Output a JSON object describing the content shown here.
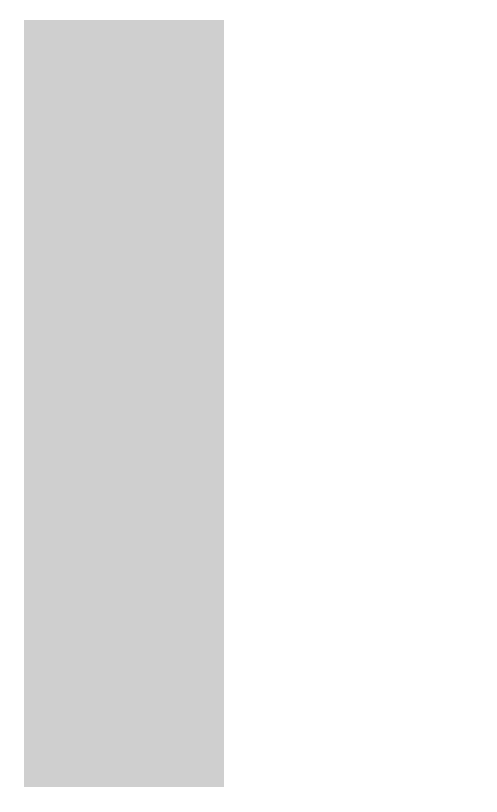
{
  "map": {
    "title_note": "DATE OF ACQUISITION GIVEN FOR U.S. POSSESSIONS",
    "colors": {
      "ocean": "#cfcfcf",
      "land": "#ffffff",
      "us_possession": "#8a8a8a",
      "outline": "#1a1a1a",
      "frame": "#222222"
    },
    "countries": {
      "canada": "CANADA",
      "united_states": "UNITED STATES",
      "mexico": "MEXICO",
      "south": "SOUTH",
      "america": "AMERICA",
      "russia": "RUSSIA",
      "china": "CHINA",
      "japan": "JAPAN",
      "australia": "AUSTRALIA"
    },
    "water": {
      "bering": "BERING",
      "sea": "SEA",
      "pacific": "PACIFIC",
      "ocean": "OCEAN"
    },
    "lines": {
      "equator": "EQUATOR",
      "international": "INTERNATIONAL",
      "date": "DATE",
      "line": "LINE"
    },
    "possessions": {
      "alaska": {
        "name": "ALASKA",
        "year": "(1867)"
      },
      "aleutian": {
        "name": "ALEUTIAN IS."
      },
      "midway": {
        "name": "MIDWAY IS.",
        "year": "(1867)"
      },
      "hawaiian": {
        "name": "HAWAIIAN IS.",
        "year": "(1898)"
      },
      "wake": {
        "name": "WAKE IS.",
        "year": "(1899)"
      },
      "guam": {
        "name": "GUAM",
        "year": "(1898)"
      },
      "philippine": {
        "name1": "PHILIPPINE",
        "name2": "ISLANDS",
        "year": "(1898)"
      },
      "samoa": {
        "name1": "AMERICAN",
        "name2": "SAMOA",
        "year": "(1899)"
      },
      "panama": {
        "name1": "PANAMA",
        "name2": "CANAL ZONE",
        "year": "(1903)"
      }
    }
  }
}
